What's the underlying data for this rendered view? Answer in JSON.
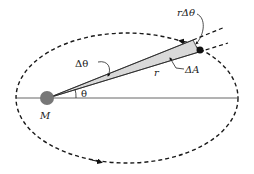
{
  "diagram": {
    "labels": {
      "mass": "M",
      "angle": "θ",
      "delta_angle": "Δθ",
      "radius": "r",
      "delta_area": "ΔA",
      "arc_length": "rΔθ"
    },
    "colors": {
      "orbit": "#1a1a1a",
      "mass": "#777777",
      "planet": "#111111",
      "wedge_fill": "#d9d9d9",
      "axis": "#555555"
    },
    "orbit": {
      "style": "dashed",
      "direction": "counter-clockwise"
    }
  }
}
